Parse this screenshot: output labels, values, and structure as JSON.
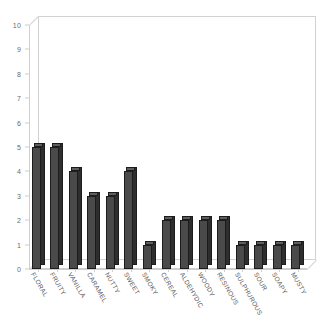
{
  "chart_data": {
    "type": "bar",
    "title": "",
    "subtitle": "",
    "xlabel": "",
    "ylabel": "",
    "ylim": [
      0,
      10
    ],
    "ytick_labels": [
      "10",
      "9",
      "8",
      "7",
      "6",
      "5",
      "4",
      "3",
      "2",
      "1",
      "0"
    ],
    "ytick_values": [
      10,
      9,
      8,
      7,
      6,
      5,
      4,
      3,
      2,
      1,
      0
    ],
    "grid": false,
    "legend": null,
    "legend_position": "none",
    "style": "3d-bar",
    "categories": [
      "FLORAL",
      "FRUITY",
      "VANILLA",
      "CARAMEL",
      "NUTTY",
      "SWEET",
      "SMOKY",
      "CEREAL",
      "ALDEHYDIC",
      "WOODY",
      "RESINOUS",
      "SULPHUROUS",
      "SOUR",
      "SOAPY",
      "MUSTY"
    ],
    "values": [
      5,
      5,
      4,
      3,
      3,
      4,
      1,
      2,
      2,
      2,
      2,
      1,
      1,
      1,
      1
    ],
    "colors": {
      "bar_front": "#4a4a4a",
      "bar_side": "#2e2e2e",
      "bar_top": "#5e5e5e",
      "bar_outline": "#1c1c1c",
      "axis": "#cfcfcf",
      "tick_text": "#6b6b6b",
      "category_text": "#5a5a5a",
      "background": "#ffffff"
    }
  },
  "footer": {
    "mark": ""
  }
}
